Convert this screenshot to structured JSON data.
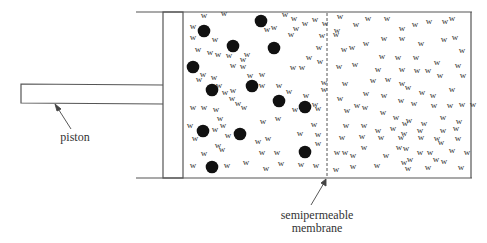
{
  "labels": {
    "piston": "piston",
    "membrane_line1": "semipermeable",
    "membrane_line2": "membrane",
    "water_symbol": "w"
  },
  "colors": {
    "line": "#555555",
    "solute": "#111111",
    "text": "#333333"
  },
  "solute_particles": [
    [
      204,
      31
    ],
    [
      261,
      21
    ],
    [
      233,
      46
    ],
    [
      274,
      48
    ],
    [
      193,
      67
    ],
    [
      212,
      90
    ],
    [
      252,
      86
    ],
    [
      279,
      101
    ],
    [
      305,
      107
    ],
    [
      203,
      131
    ],
    [
      240,
      134
    ],
    [
      305,
      152
    ],
    [
      212,
      167
    ]
  ],
  "water_left": [
    [
      204,
      18
    ],
    [
      224,
      16
    ],
    [
      193,
      29
    ],
    [
      215,
      42
    ],
    [
      193,
      40
    ],
    [
      198,
      52
    ],
    [
      210,
      55
    ],
    [
      218,
      57
    ],
    [
      229,
      58
    ],
    [
      243,
      62
    ],
    [
      247,
      57
    ],
    [
      285,
      17
    ],
    [
      294,
      21
    ],
    [
      305,
      26
    ],
    [
      315,
      22
    ],
    [
      267,
      32
    ],
    [
      274,
      30
    ],
    [
      296,
      31
    ],
    [
      291,
      37
    ],
    [
      233,
      68
    ],
    [
      243,
      69
    ],
    [
      203,
      77
    ],
    [
      214,
      80
    ],
    [
      219,
      88
    ],
    [
      250,
      78
    ],
    [
      262,
      77
    ],
    [
      293,
      70
    ],
    [
      302,
      70
    ],
    [
      309,
      60
    ],
    [
      320,
      64
    ],
    [
      199,
      82
    ],
    [
      225,
      95
    ],
    [
      233,
      93
    ],
    [
      262,
      88
    ],
    [
      279,
      88
    ],
    [
      289,
      94
    ],
    [
      315,
      107
    ],
    [
      193,
      110
    ],
    [
      204,
      110
    ],
    [
      232,
      101
    ],
    [
      238,
      106
    ],
    [
      244,
      110
    ],
    [
      216,
      112
    ],
    [
      220,
      121
    ],
    [
      223,
      128
    ],
    [
      263,
      124
    ],
    [
      278,
      121
    ],
    [
      295,
      112
    ],
    [
      306,
      98
    ],
    [
      318,
      111
    ],
    [
      190,
      128
    ],
    [
      215,
      132
    ],
    [
      228,
      138
    ],
    [
      218,
      148
    ],
    [
      222,
      152
    ],
    [
      195,
      141
    ],
    [
      204,
      156
    ],
    [
      258,
      144
    ],
    [
      268,
      141
    ],
    [
      262,
      155
    ],
    [
      277,
      155
    ],
    [
      193,
      168
    ],
    [
      227,
      168
    ],
    [
      246,
      165
    ],
    [
      266,
      171
    ],
    [
      281,
      166
    ],
    [
      301,
      167
    ],
    [
      318,
      146
    ],
    [
      318,
      137
    ],
    [
      300,
      136
    ],
    [
      314,
      127
    ],
    [
      316,
      168
    ],
    [
      322,
      38
    ],
    [
      325,
      26
    ],
    [
      319,
      50
    ],
    [
      324,
      85
    ],
    [
      324,
      92
    ]
  ],
  "water_right": [
    [
      340,
      19
    ],
    [
      356,
      27
    ],
    [
      368,
      21
    ],
    [
      387,
      21
    ],
    [
      402,
      31
    ],
    [
      415,
      27
    ],
    [
      429,
      24
    ],
    [
      445,
      24
    ],
    [
      452,
      21
    ],
    [
      337,
      33
    ],
    [
      336,
      37
    ],
    [
      352,
      50
    ],
    [
      366,
      46
    ],
    [
      384,
      41
    ],
    [
      402,
      41
    ],
    [
      421,
      46
    ],
    [
      444,
      42
    ],
    [
      455,
      40
    ],
    [
      462,
      53
    ],
    [
      344,
      52
    ],
    [
      382,
      59
    ],
    [
      398,
      60
    ],
    [
      416,
      60
    ],
    [
      437,
      65
    ],
    [
      458,
      68
    ],
    [
      339,
      69
    ],
    [
      355,
      67
    ],
    [
      378,
      72
    ],
    [
      402,
      72
    ],
    [
      417,
      73
    ],
    [
      428,
      73
    ],
    [
      440,
      78
    ],
    [
      463,
      78
    ],
    [
      345,
      86
    ],
    [
      373,
      83
    ],
    [
      388,
      82
    ],
    [
      402,
      86
    ],
    [
      408,
      90
    ],
    [
      422,
      95
    ],
    [
      433,
      98
    ],
    [
      452,
      92
    ],
    [
      462,
      107
    ],
    [
      340,
      101
    ],
    [
      366,
      96
    ],
    [
      384,
      98
    ],
    [
      401,
      103
    ],
    [
      414,
      106
    ],
    [
      434,
      108
    ],
    [
      450,
      108
    ],
    [
      473,
      107
    ],
    [
      347,
      113
    ],
    [
      357,
      108
    ],
    [
      365,
      110
    ],
    [
      383,
      115
    ],
    [
      396,
      120
    ],
    [
      409,
      123
    ],
    [
      424,
      126
    ],
    [
      443,
      120
    ],
    [
      459,
      124
    ],
    [
      346,
      128
    ],
    [
      364,
      128
    ],
    [
      378,
      133
    ],
    [
      393,
      131
    ],
    [
      405,
      126
    ],
    [
      404,
      136
    ],
    [
      420,
      133
    ],
    [
      443,
      133
    ],
    [
      456,
      131
    ],
    [
      342,
      140
    ],
    [
      362,
      139
    ],
    [
      381,
      140
    ],
    [
      401,
      140
    ],
    [
      421,
      140
    ],
    [
      437,
      141
    ],
    [
      441,
      145
    ],
    [
      458,
      141
    ],
    [
      345,
      155
    ],
    [
      364,
      150
    ],
    [
      399,
      150
    ],
    [
      406,
      151
    ],
    [
      420,
      155
    ],
    [
      430,
      155
    ],
    [
      452,
      153
    ],
    [
      467,
      155
    ],
    [
      337,
      155
    ],
    [
      353,
      158
    ],
    [
      386,
      158
    ],
    [
      410,
      162
    ],
    [
      444,
      164
    ],
    [
      436,
      162
    ],
    [
      336,
      172
    ],
    [
      353,
      169
    ],
    [
      377,
      168
    ],
    [
      404,
      165
    ],
    [
      408,
      171
    ],
    [
      428,
      170
    ],
    [
      461,
      170
    ]
  ]
}
